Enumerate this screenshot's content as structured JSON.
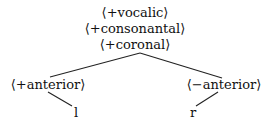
{
  "tree": {
    "root": {
      "features": [
        "⟨+vocalic⟩",
        "⟨+consonantal⟩",
        "⟨+coronal⟩"
      ]
    },
    "left": {
      "feature": "⟨+anterior⟩",
      "leaf": "l"
    },
    "right": {
      "feature": "⟨−anterior⟩",
      "leaf": "r"
    }
  }
}
